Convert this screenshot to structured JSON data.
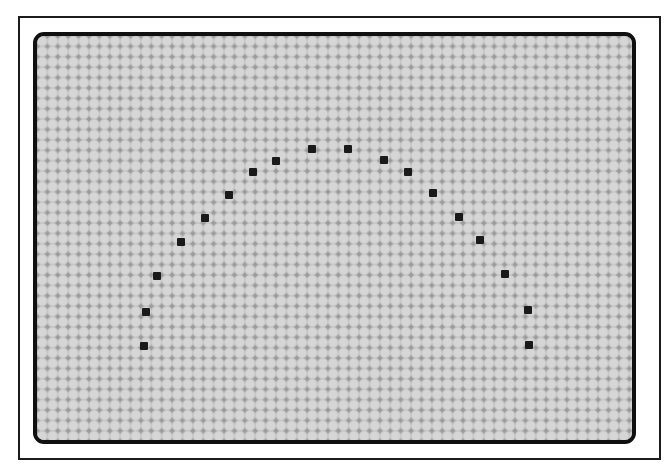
{
  "colors": {
    "page_background": "#ffffff",
    "frame_border": "#1c1c1c",
    "panel_border": "#101010",
    "grid_gutter": "#9b9b9b",
    "grid_cell": "#d6d6d6",
    "grid_cell_edge": "#bfbfbf",
    "point": "#1a1a1a"
  },
  "lcd_grid": {
    "pitch_px": 10.4,
    "approx_cols": 57,
    "approx_rows": 39
  },
  "chart_data": {
    "type": "scatter",
    "marker": "filled-square",
    "marker_size_px": 8,
    "point_color": "#1a1a1a",
    "points": [
      [
        144,
        346
      ],
      [
        146,
        312
      ],
      [
        157,
        276
      ],
      [
        181,
        242
      ],
      [
        205,
        218
      ],
      [
        229,
        195
      ],
      [
        253,
        172
      ],
      [
        276,
        161
      ],
      [
        312,
        149
      ],
      [
        348,
        149
      ],
      [
        384,
        160
      ],
      [
        408,
        172
      ],
      [
        433,
        193
      ],
      [
        459,
        217
      ],
      [
        480,
        240
      ],
      [
        505,
        274
      ],
      [
        528,
        310
      ],
      [
        529,
        345
      ]
    ]
  }
}
